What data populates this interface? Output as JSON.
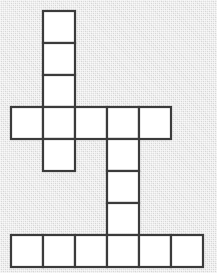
{
  "figure": {
    "name": "polyomino-grid-figure",
    "background_color": "#e2e2e2",
    "cell_fill_color": "#ffffff",
    "cell_stroke_color": "#3b3b3b",
    "stroke_width": 2.2,
    "cell_size": 32,
    "origin_x": 11,
    "origin_y": 11,
    "columns": 6,
    "rows": 8,
    "total_cells": 18,
    "groups": [
      {
        "name": "top-vertical-stem",
        "cell_count": 3
      },
      {
        "name": "upper-horizontal-bar",
        "cell_count": 5
      },
      {
        "name": "left-hanging-cell",
        "cell_count": 1
      },
      {
        "name": "lower-vertical-stem",
        "cell_count": 3
      },
      {
        "name": "bottom-horizontal-bar",
        "cell_count": 6
      }
    ],
    "cells": [
      {
        "col": 1,
        "row": 0,
        "group": "top-vertical-stem"
      },
      {
        "col": 1,
        "row": 1,
        "group": "top-vertical-stem"
      },
      {
        "col": 1,
        "row": 2,
        "group": "top-vertical-stem"
      },
      {
        "col": 0,
        "row": 3,
        "group": "upper-horizontal-bar"
      },
      {
        "col": 1,
        "row": 3,
        "group": "upper-horizontal-bar"
      },
      {
        "col": 2,
        "row": 3,
        "group": "upper-horizontal-bar"
      },
      {
        "col": 3,
        "row": 3,
        "group": "upper-horizontal-bar"
      },
      {
        "col": 4,
        "row": 3,
        "group": "upper-horizontal-bar"
      },
      {
        "col": 1,
        "row": 4,
        "group": "left-hanging-cell"
      },
      {
        "col": 3,
        "row": 4,
        "group": "lower-vertical-stem"
      },
      {
        "col": 3,
        "row": 5,
        "group": "lower-vertical-stem"
      },
      {
        "col": 3,
        "row": 6,
        "group": "lower-vertical-stem"
      },
      {
        "col": 0,
        "row": 7,
        "group": "bottom-horizontal-bar"
      },
      {
        "col": 1,
        "row": 7,
        "group": "bottom-horizontal-bar"
      },
      {
        "col": 2,
        "row": 7,
        "group": "bottom-horizontal-bar"
      },
      {
        "col": 3,
        "row": 7,
        "group": "bottom-horizontal-bar"
      },
      {
        "col": 4,
        "row": 7,
        "group": "bottom-horizontal-bar"
      },
      {
        "col": 5,
        "row": 7,
        "group": "bottom-horizontal-bar"
      }
    ]
  }
}
